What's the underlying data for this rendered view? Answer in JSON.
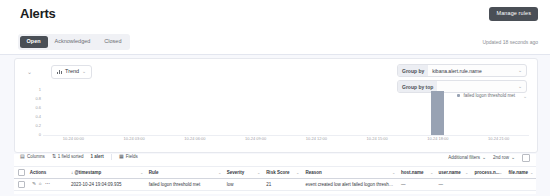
{
  "header": {
    "title": "Alerts",
    "manage_rules_label": "Manage rules"
  },
  "tabs": {
    "items": [
      {
        "label": "Open",
        "active": true
      },
      {
        "label": "Acknowledged",
        "active": false
      },
      {
        "label": "Closed",
        "active": false
      }
    ],
    "updated_text": "Updated 18 seconds ago"
  },
  "chart": {
    "collapse_icon": "chevron-down",
    "trend_label": "Trend",
    "group_by_tag": "Group by",
    "group_by_value": "kibana.alert.rule.name",
    "group_by_top_tag": "Group by top",
    "group_by_top_value": "",
    "legend_label": "failed logon threshold met",
    "legend_more": "⌄"
  },
  "chart_data": {
    "type": "bar",
    "title": "",
    "xlabel": "",
    "ylabel": "",
    "categories": [
      "10-24 09:00",
      "10-24 03:00",
      "10-24 06:00",
      "10-24 09:00",
      "10-24 12:00",
      "10-24 15:00",
      "10-24 18:00",
      "10-24 21:00"
    ],
    "x_tick_labels": [
      "10-24 00:00",
      "10-24 03:00",
      "10-24 06:00",
      "10-24 09:00",
      "10-24 12:00",
      "10-24 15:00",
      "10-24 18:00",
      "10-24 21:00"
    ],
    "y_tick_labels": [
      "1",
      "0.8",
      "0.6",
      "0.4",
      "0.2",
      "0"
    ],
    "ylim": [
      0,
      1
    ],
    "values": [
      0,
      0,
      0,
      0,
      0,
      0,
      1,
      0
    ],
    "series": [
      {
        "name": "failed logon threshold met",
        "values": [
          0,
          0,
          0,
          0,
          0,
          0,
          1,
          0
        ],
        "color": "#98a2b3"
      }
    ],
    "grid": false,
    "legend_position": "top-right"
  },
  "table": {
    "toolbar": {
      "columns_label": "Columns",
      "sorted_label": "1 field sorted",
      "count_label": "1 alert",
      "fields_label": "Fields",
      "additional_filters_label": "Additional filters",
      "rows_label": "2nd row",
      "fullscreen_icon": "fullscreen-icon"
    },
    "columns": [
      {
        "label": "Actions",
        "width": 46
      },
      {
        "label": "@timestamp",
        "width": 88
      },
      {
        "label": "Rule",
        "width": 88
      },
      {
        "label": "Severity",
        "width": 44
      },
      {
        "label": "Risk Score",
        "width": 44
      },
      {
        "label": "Reason",
        "width": 108
      },
      {
        "label": "host.name",
        "width": 42
      },
      {
        "label": "user.name",
        "width": 40
      },
      {
        "label": "process.n...",
        "width": 38
      },
      {
        "label": "file.name",
        "width": 34
      }
    ],
    "rows": [
      {
        "timestamp": "2023-10-24 19:04:09.935",
        "rule": "failed logon threshold met",
        "severity": "low",
        "risk_score": "21",
        "reason": "event created low alert failed logon threshold met.",
        "host_name": "—",
        "user_name": "—",
        "process_name": "",
        "file_name": ""
      }
    ]
  },
  "colors": {
    "accent": "#4a4f56",
    "bar": "#98a2b3",
    "panel_border": "#e6e8ee"
  }
}
